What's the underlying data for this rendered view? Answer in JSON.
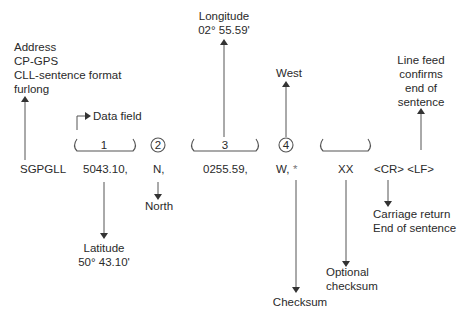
{
  "diagram": {
    "type": "NMEA sentence breakdown",
    "header_label": {
      "lines": [
        "Address",
        "CP-GPS",
        "CLL-sentence format",
        "furlong"
      ]
    },
    "data_field_label": "Data field",
    "sentence": {
      "address": "SGPGLL",
      "latitude_value": "5043.10,",
      "ns_value": "N,",
      "longitude_value": "0255.59,",
      "ew_value": "W,",
      "checksum_marker": "*",
      "checksum_value": "XX",
      "terminators": "<CR> <LF>"
    },
    "field_markers": {
      "f1": "1",
      "f2": "2",
      "f3": "3",
      "f4": "4"
    },
    "annotations": {
      "longitude": [
        "Longitude",
        "02° 55.59'"
      ],
      "west": "West",
      "line_feed": [
        "Line feed",
        "confirms",
        "end of",
        "sentence"
      ],
      "north": "North",
      "latitude": [
        "Latitude",
        "50° 43.10'"
      ],
      "checksum": "Checksum",
      "optional_checksum": [
        "Optional",
        "checksum"
      ],
      "carriage_return": [
        "Carriage return",
        "End of sentence"
      ]
    }
  }
}
